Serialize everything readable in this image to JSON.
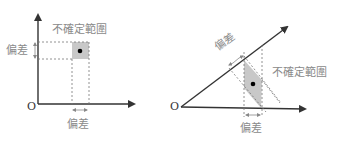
{
  "left_panel": {
    "origin_label": "O",
    "region_label": "不確定範圍",
    "y_deviation_label": "偏差",
    "x_deviation_label": "偏差"
  },
  "right_panel": {
    "origin_label": "O",
    "region_label": "不確定範圍",
    "diagonal_deviation_label": "偏差",
    "x_deviation_label": "偏差"
  },
  "colors": {
    "axis": "#333333",
    "dashed": "#777777",
    "region_fill": "#c8c8c8",
    "label": "#8a8a8a",
    "dot": "#000000"
  }
}
